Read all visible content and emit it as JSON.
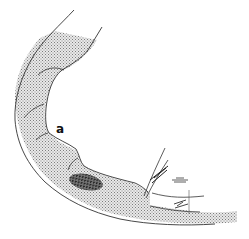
{
  "figure": {
    "type": "anatomical line drawing",
    "labels": [
      {
        "text": "a",
        "x": 58,
        "y": 132
      }
    ],
    "colors": {
      "background": "#ffffff",
      "outline": "#333333",
      "stipple": "#9a9a9a",
      "dense_patch": "#222222"
    }
  }
}
